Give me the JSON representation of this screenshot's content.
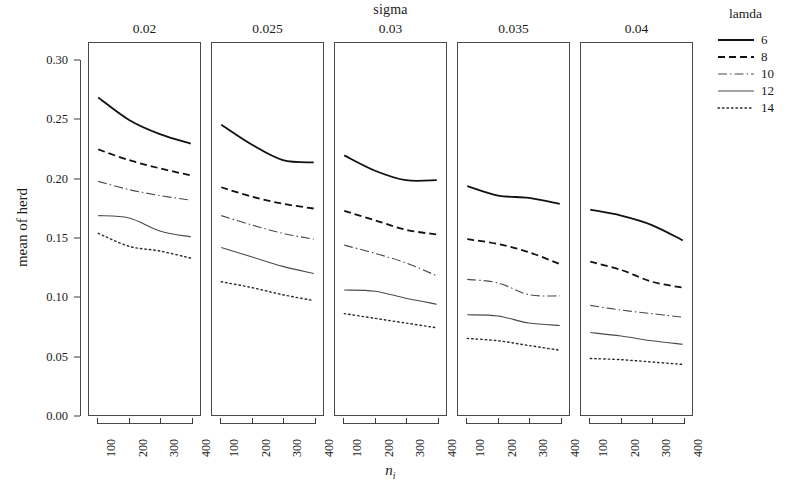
{
  "chart_data": {
    "type": "line",
    "title": "sigma",
    "xlabel": "n_i",
    "xlabel_base": "n",
    "xlabel_sub": "i",
    "ylabel": "mean of herd",
    "x": [
      100,
      200,
      300,
      400
    ],
    "xticks": [
      "100",
      "200",
      "300",
      "400"
    ],
    "yticks": [
      "0.00",
      "0.05",
      "0.10",
      "0.15",
      "0.20",
      "0.25",
      "0.30"
    ],
    "ytick_values": [
      0.0,
      0.05,
      0.1,
      0.15,
      0.2,
      0.25,
      0.3
    ],
    "ylim": [
      0.0,
      0.315
    ],
    "xlim": [
      70,
      430
    ],
    "grid": false,
    "legend_position": "right",
    "legend_title": "lamda",
    "facet_variable": "sigma",
    "facets": [
      {
        "label": "0.02",
        "series": [
          {
            "name": "6",
            "values": [
              0.268,
              0.249,
              0.237,
              0.229
            ]
          },
          {
            "name": "8",
            "values": [
              0.224,
              0.215,
              0.208,
              0.202
            ]
          },
          {
            "name": "10",
            "values": [
              0.197,
              0.19,
              0.185,
              0.181
            ]
          },
          {
            "name": "12",
            "values": [
              0.168,
              0.166,
              0.155,
              0.15
            ]
          },
          {
            "name": "14",
            "values": [
              0.153,
              0.142,
              0.138,
              0.132
            ]
          }
        ]
      },
      {
        "label": "0.025",
        "series": [
          {
            "name": "6",
            "values": [
              0.245,
              0.228,
              0.215,
              0.213
            ]
          },
          {
            "name": "8",
            "values": [
              0.192,
              0.184,
              0.178,
              0.174
            ]
          },
          {
            "name": "10",
            "values": [
              0.168,
              0.16,
              0.153,
              0.148
            ]
          },
          {
            "name": "12",
            "values": [
              0.141,
              0.133,
              0.125,
              0.119
            ]
          },
          {
            "name": "14",
            "values": [
              0.112,
              0.107,
              0.101,
              0.096
            ]
          }
        ]
      },
      {
        "label": "0.03",
        "series": [
          {
            "name": "6",
            "values": [
              0.219,
              0.206,
              0.198,
              0.198
            ]
          },
          {
            "name": "8",
            "values": [
              0.172,
              0.164,
              0.156,
              0.152
            ]
          },
          {
            "name": "10",
            "values": [
              0.143,
              0.136,
              0.128,
              0.117
            ]
          },
          {
            "name": "12",
            "values": [
              0.105,
              0.104,
              0.098,
              0.093
            ]
          },
          {
            "name": "14",
            "values": [
              0.085,
              0.081,
              0.077,
              0.073
            ]
          }
        ]
      },
      {
        "label": "0.035",
        "series": [
          {
            "name": "6",
            "values": [
              0.193,
              0.185,
              0.183,
              0.178
            ]
          },
          {
            "name": "8",
            "values": [
              0.148,
              0.144,
              0.137,
              0.127
            ]
          },
          {
            "name": "10",
            "values": [
              0.114,
              0.111,
              0.101,
              0.1
            ]
          },
          {
            "name": "12",
            "values": [
              0.084,
              0.083,
              0.077,
              0.075
            ]
          },
          {
            "name": "14",
            "values": [
              0.064,
              0.062,
              0.058,
              0.054
            ]
          }
        ]
      },
      {
        "label": "0.04",
        "series": [
          {
            "name": "6",
            "values": [
              0.173,
              0.168,
              0.16,
              0.147
            ]
          },
          {
            "name": "8",
            "values": [
              0.129,
              0.122,
              0.112,
              0.107
            ]
          },
          {
            "name": "10",
            "values": [
              0.092,
              0.088,
              0.085,
              0.082
            ]
          },
          {
            "name": "12",
            "values": [
              0.069,
              0.066,
              0.062,
              0.059
            ]
          },
          {
            "name": "14",
            "values": [
              0.047,
              0.046,
              0.044,
              0.042
            ]
          }
        ]
      }
    ],
    "legend_entries": [
      {
        "label": "6",
        "style": "solid",
        "width": 1.8,
        "color": "#111111"
      },
      {
        "label": "8",
        "style": "dashed",
        "width": 1.8,
        "color": "#111111"
      },
      {
        "label": "10",
        "style": "dashdot",
        "width": 1.1,
        "color": "#4a4a4a"
      },
      {
        "label": "12",
        "style": "solid",
        "width": 1.1,
        "color": "#4a4a4a"
      },
      {
        "label": "14",
        "style": "dotted",
        "width": 1.4,
        "color": "#2b2b2b"
      }
    ]
  }
}
